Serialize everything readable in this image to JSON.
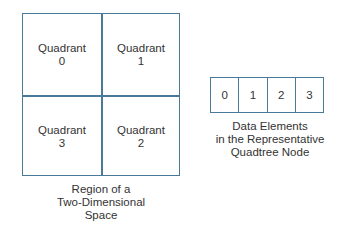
{
  "region": {
    "quadrants": [
      {
        "label": "Quadrant",
        "index": "0"
      },
      {
        "label": "Quadrant",
        "index": "1"
      },
      {
        "label": "Quadrant",
        "index": "2"
      },
      {
        "label": "Quadrant",
        "index": "3"
      }
    ],
    "caption": [
      "Region of a",
      "Two-Dimensional",
      "Space"
    ]
  },
  "node": {
    "cells": [
      "0",
      "1",
      "2",
      "3"
    ],
    "caption": [
      "Data Elements",
      "in the Representative",
      "Quadtree Node"
    ]
  },
  "colors": {
    "line": "#4a7a9a",
    "text": "#333333",
    "background": "#ffffff"
  }
}
